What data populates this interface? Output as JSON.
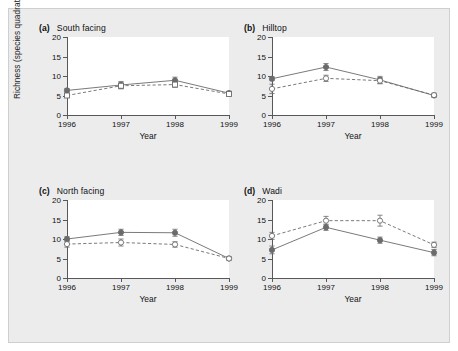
{
  "figure": {
    "background_color": "#ececed",
    "panel_background": "#ffffff",
    "axis_color": "#58585a",
    "series_color": "#6b6b6d"
  },
  "axes": {
    "ylabel_main": "Richness (species quadrat",
    "ylabel_exponent": "−1",
    "ylabel_close": ")",
    "xlabel": "Year",
    "ytick_labels": [
      "0",
      "5",
      "10",
      "15",
      "20"
    ],
    "xtick_labels": [
      "1996",
      "1997",
      "1998",
      "1999"
    ]
  },
  "panels": [
    {
      "letter": "(a)",
      "title": "South facing"
    },
    {
      "letter": "(b)",
      "title": "Hilltop"
    },
    {
      "letter": "(c)",
      "title": "North facing"
    },
    {
      "letter": "(d)",
      "title": "Wadi"
    }
  ],
  "chart_data": [
    {
      "type": "line",
      "title": "(a) South facing",
      "xlabel": "Year",
      "ylabel": "Richness (species quadrat−1)",
      "x": [
        "1996",
        "1997",
        "1998",
        "1999"
      ],
      "xlim": [
        1996,
        1999
      ],
      "ylim": [
        0,
        20
      ],
      "yticks": [
        0,
        5,
        10,
        15,
        20
      ],
      "grid": false,
      "legend": "none",
      "series": [
        {
          "name": "filled-circle-solid",
          "marker": "filled-circle",
          "line": "solid",
          "values": [
            6.3,
            7.7,
            8.9,
            5.6
          ],
          "errors": [
            0.5,
            0.9,
            0.8,
            0.5
          ]
        },
        {
          "name": "open-square-dashed",
          "marker": "open-square",
          "line": "dashed",
          "values": [
            5.0,
            7.5,
            7.8,
            5.4
          ],
          "errors": [
            0.4,
            0.8,
            0.7,
            0.5
          ]
        }
      ]
    },
    {
      "type": "line",
      "title": "(b) Hilltop",
      "xlabel": "Year",
      "ylabel": "Richness (species quadrat−1)",
      "x": [
        "1996",
        "1997",
        "1998",
        "1999"
      ],
      "xlim": [
        1996,
        1999
      ],
      "ylim": [
        0,
        20
      ],
      "yticks": [
        0,
        5,
        10,
        15,
        20
      ],
      "grid": false,
      "legend": "none",
      "series": [
        {
          "name": "filled-circle-solid",
          "marker": "filled-circle",
          "line": "solid",
          "values": [
            9.3,
            12.3,
            9.0,
            5.0
          ],
          "errors": [
            0.5,
            0.9,
            0.9,
            0.4
          ]
        },
        {
          "name": "open-circle-dashed",
          "marker": "open-circle",
          "line": "dashed",
          "values": [
            6.7,
            9.4,
            8.8,
            5.1
          ],
          "errors": [
            1.2,
            0.8,
            0.8,
            0.5
          ]
        }
      ]
    },
    {
      "type": "line",
      "title": "(c) North facing",
      "xlabel": "Year",
      "ylabel": "Richness (species quadrat−1)",
      "x": [
        "1996",
        "1997",
        "1998",
        "1999"
      ],
      "xlim": [
        1996,
        1999
      ],
      "ylim": [
        0,
        20
      ],
      "yticks": [
        0,
        5,
        10,
        15,
        20
      ],
      "grid": false,
      "legend": "none",
      "series": [
        {
          "name": "filled-circle-solid",
          "marker": "filled-circle",
          "line": "solid",
          "values": [
            10.0,
            11.7,
            11.6,
            5.0
          ],
          "errors": [
            0.6,
            0.8,
            0.9,
            0.4
          ]
        },
        {
          "name": "open-circle-dashed",
          "marker": "open-circle",
          "line": "dashed",
          "values": [
            8.7,
            9.1,
            8.6,
            5.0
          ],
          "errors": [
            0.8,
            0.9,
            0.7,
            0.4
          ]
        }
      ]
    },
    {
      "type": "line",
      "title": "(d) Wadi",
      "xlabel": "Year",
      "ylabel": "Richness (species quadrat−1)",
      "x": [
        "1996",
        "1997",
        "1998",
        "1999"
      ],
      "xlim": [
        1996,
        1999
      ],
      "ylim": [
        0,
        20
      ],
      "yticks": [
        0,
        5,
        10,
        15,
        20
      ],
      "grid": false,
      "legend": "none",
      "series": [
        {
          "name": "filled-circle-solid",
          "marker": "filled-circle",
          "line": "solid",
          "values": [
            7.2,
            13.0,
            9.7,
            6.5
          ],
          "errors": [
            1.0,
            0.8,
            0.8,
            0.8
          ]
        },
        {
          "name": "open-circle-dashed",
          "marker": "open-circle",
          "line": "dashed",
          "values": [
            10.8,
            14.7,
            14.7,
            8.5
          ],
          "errors": [
            0.9,
            1.1,
            1.4,
            0.7
          ]
        }
      ]
    }
  ]
}
